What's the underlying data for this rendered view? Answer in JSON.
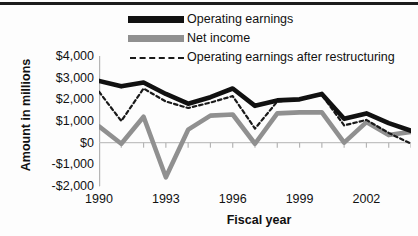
{
  "chart": {
    "title": "",
    "ylabel": "Amount in millions",
    "xlabel": "Fiscal year"
  },
  "legend": {
    "position": "top-center",
    "items": [
      {
        "label": "Operating earnings",
        "style": "solid-thick-black",
        "color": "#111111",
        "icon": "line-swatch-icon"
      },
      {
        "label": "Net income",
        "style": "solid-thick-gray",
        "color": "#909090",
        "icon": "line-swatch-icon"
      },
      {
        "label": "Operating earnings after restructuring",
        "style": "dashed-thin-black",
        "color": "#1a1a1a",
        "icon": "dashed-line-swatch-icon"
      }
    ]
  },
  "axes": {
    "y_ticks": [
      "$4,000",
      "$3,000",
      "$2,000",
      "$1,000",
      "$0",
      "-$1,000",
      "-$2,000"
    ],
    "y_tick_values": [
      4000,
      3000,
      2000,
      1000,
      0,
      -1000,
      -2000
    ],
    "x_ticks": [
      "1990",
      "1993",
      "1996",
      "1999",
      "2002"
    ],
    "x_tick_values": [
      1990,
      1993,
      1996,
      1999,
      2002
    ]
  },
  "chart_data": {
    "type": "line",
    "title": "",
    "xlabel": "Fiscal year",
    "ylabel": "Amount in millions",
    "xlim": [
      1990,
      2004
    ],
    "ylim": [
      -2000,
      4000
    ],
    "grid": false,
    "legend_position": "top-center",
    "categories": [
      1990,
      1991,
      1992,
      1993,
      1994,
      1995,
      1996,
      1997,
      1998,
      1999,
      2000,
      2001,
      2002,
      2003,
      2004
    ],
    "series": [
      {
        "name": "Operating earnings",
        "color": "#111111",
        "style": "solid",
        "values": [
          2850,
          2600,
          2780,
          2250,
          1800,
          2100,
          2500,
          1700,
          1950,
          2000,
          2250,
          1100,
          1350,
          900,
          550
        ]
      },
      {
        "name": "Net income",
        "color": "#909090",
        "style": "solid",
        "values": [
          750,
          -50,
          1200,
          -1600,
          600,
          1250,
          1300,
          -50,
          1350,
          1400,
          1400,
          0,
          950,
          350,
          500
        ]
      },
      {
        "name": "Operating earnings after restructuring",
        "color": "#1a1a1a",
        "style": "dashed",
        "values": [
          2350,
          1000,
          2500,
          1900,
          1600,
          1850,
          2150,
          650,
          1900,
          2000,
          2200,
          800,
          1050,
          450,
          -50
        ]
      }
    ]
  }
}
